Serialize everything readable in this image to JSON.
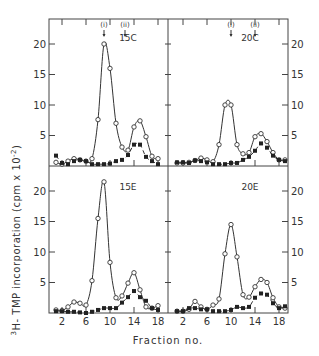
{
  "figure": {
    "ylabel": "3H-TMP  incorporation  (cpm x 10-2)",
    "xlabel": "Fraction  no.",
    "y_ticks": [
      "5",
      "10",
      "15",
      "20"
    ],
    "x_ticks": [
      "2",
      "6",
      "10",
      "14",
      "18"
    ],
    "markers": [
      "(i)",
      "(ii)"
    ]
  },
  "chart_data": [
    {
      "type": "line",
      "panel": "15C",
      "position": "top-left",
      "marker_fractions": {
        "(i)": 9,
        "(ii)": 12.5
      },
      "xlabel": "Fraction no.",
      "ylabel": "3H-TMP incorporation (cpm x 10^-2)",
      "ylim": [
        0,
        23
      ],
      "x": [
        1,
        2,
        3,
        4,
        5,
        6,
        7,
        8,
        9,
        10,
        11,
        12,
        13,
        14,
        15,
        16,
        17,
        18
      ],
      "series": [
        {
          "name": "open circles",
          "style": "solid",
          "values": [
            0.6,
            0.3,
            0.8,
            1.2,
            1.0,
            0.8,
            1.2,
            7.6,
            20.0,
            16.0,
            7.0,
            3.1,
            2.6,
            6.4,
            7.4,
            4.8,
            1.6,
            1.2
          ]
        },
        {
          "name": "filled circles",
          "style": "dashed",
          "values": [
            1.7,
            0.5,
            0.3,
            0.8,
            1.0,
            0.8,
            0.3,
            0.3,
            0.3,
            0.4,
            0.8,
            1.0,
            1.8,
            3.5,
            3.5,
            1.5,
            0.8,
            0.3
          ]
        }
      ]
    },
    {
      "type": "line",
      "panel": "20C",
      "position": "top-right",
      "marker_fractions": {
        "(i)": 10,
        "(ii)": 14
      },
      "ylim": [
        0,
        23
      ],
      "x": [
        1,
        2,
        3,
        4,
        5,
        6,
        7,
        8,
        9,
        10,
        11,
        12,
        13,
        14,
        15,
        16,
        17,
        18,
        19
      ],
      "series": [
        {
          "name": "open circles",
          "style": "solid",
          "values": [
            0.5,
            0.5,
            0.6,
            0.9,
            1.3,
            1.0,
            0.7,
            3.5,
            10.0,
            10.0,
            3.5,
            2.0,
            2.2,
            4.8,
            5.3,
            4.0,
            2.2,
            1.0,
            1.0
          ]
        },
        {
          "name": "filled circles",
          "style": "dashed",
          "values": [
            0.6,
            0.6,
            0.5,
            0.9,
            0.8,
            0.6,
            0.3,
            0.3,
            0.3,
            0.5,
            0.5,
            1.0,
            1.5,
            2.5,
            3.7,
            3.0,
            1.7,
            1.0,
            0.8
          ]
        }
      ]
    },
    {
      "type": "line",
      "panel": "15E",
      "position": "bottom-left",
      "ylim": [
        0,
        23
      ],
      "x": [
        1,
        2,
        3,
        4,
        5,
        6,
        7,
        8,
        9,
        10,
        11,
        12,
        13,
        14,
        15,
        16,
        17,
        18
      ],
      "series": [
        {
          "name": "open circles",
          "style": "solid",
          "values": [
            0.5,
            0.4,
            1.0,
            1.8,
            1.6,
            1.3,
            5.3,
            15.5,
            21.5,
            8.3,
            2.5,
            2.8,
            4.9,
            6.6,
            3.8,
            1.0,
            0.8,
            1.2
          ]
        },
        {
          "name": "filled circles",
          "style": "dashed",
          "values": [
            0.3,
            0.3,
            0.2,
            0.2,
            0.1,
            0.0,
            0.2,
            0.5,
            0.8,
            0.8,
            0.8,
            1.7,
            2.6,
            3.6,
            2.6,
            2.0,
            0.8,
            0.5
          ]
        }
      ]
    },
    {
      "type": "line",
      "panel": "20E",
      "position": "bottom-right",
      "ylim": [
        0,
        23
      ],
      "x": [
        1,
        2,
        3,
        4,
        5,
        6,
        7,
        8,
        9,
        10,
        11,
        12,
        13,
        14,
        15,
        16,
        17,
        18,
        19
      ],
      "series": [
        {
          "name": "open circles",
          "style": "solid",
          "values": [
            0.3,
            0.3,
            0.6,
            1.9,
            1.0,
            0.6,
            1.3,
            2.3,
            9.7,
            14.5,
            9.2,
            3.0,
            2.6,
            4.3,
            5.5,
            5.0,
            2.5,
            1.0,
            0.8
          ]
        },
        {
          "name": "filled circles",
          "style": "dashed",
          "values": [
            0.3,
            0.3,
            0.8,
            0.8,
            0.6,
            0.6,
            0.3,
            0.3,
            0.3,
            0.5,
            1.0,
            0.8,
            1.0,
            2.5,
            3.2,
            3.0,
            1.6,
            0.8,
            1.1
          ]
        }
      ]
    }
  ]
}
